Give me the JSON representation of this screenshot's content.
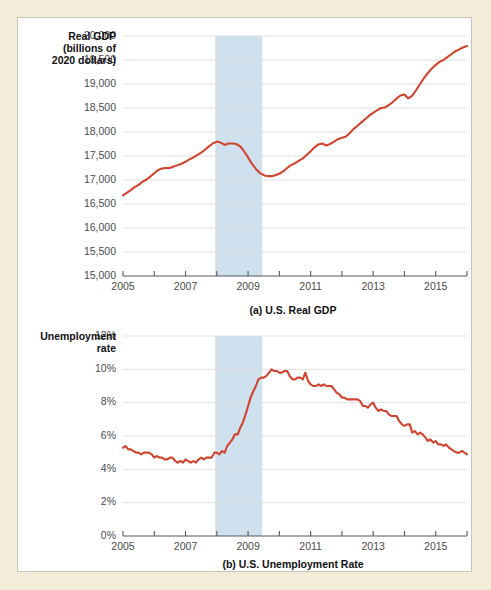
{
  "figure": {
    "background_color": "#f2ecd9",
    "panel_color": "#ffffff",
    "line_color": "#d1442f",
    "recession_band_color": "#cfe0ef",
    "gridline_color": "#dcdcde",
    "axis_color": "#58585a"
  },
  "chart_data": [
    {
      "type": "line",
      "id": "us-real-gdp",
      "title": "(a) U.S. Real GDP",
      "ylabel": "Real GDP (billions of 2020 dollars)",
      "ylabel_lines": [
        "Real GDP",
        "(billions of",
        "2020 dollars)"
      ],
      "xlabel": "",
      "grid": true,
      "legend": "none",
      "xlim": [
        2005.0,
        2016.0
      ],
      "ylim": [
        15000,
        20000
      ],
      "ytick_labels": [
        "15,000",
        "15,500",
        "16,000",
        "16,500",
        "17,000",
        "17,500",
        "18,000",
        "18,500",
        "19,000",
        "19,500",
        "20,000"
      ],
      "ytick_values": [
        15000,
        15500,
        16000,
        16500,
        17000,
        17500,
        18000,
        18500,
        19000,
        19500,
        20000
      ],
      "xtick_values": [
        2005,
        2006,
        2007,
        2008,
        2009,
        2010,
        2011,
        2012,
        2013,
        2014,
        2015,
        2016
      ],
      "xtick_labels": [
        "2005",
        "",
        "2007",
        "",
        "2009",
        "",
        "2011",
        "",
        "2013",
        "",
        "2015",
        ""
      ],
      "annotations": [
        {
          "name": "recession-shading",
          "x_start": 2007.95,
          "x_end": 2009.45,
          "label": "Great Recession"
        }
      ],
      "x": [
        2005.0,
        2005.12,
        2005.25,
        2005.37,
        2005.5,
        2005.62,
        2005.75,
        2005.87,
        2006.0,
        2006.12,
        2006.25,
        2006.37,
        2006.5,
        2006.62,
        2006.75,
        2006.87,
        2007.0,
        2007.12,
        2007.25,
        2007.37,
        2007.5,
        2007.62,
        2007.75,
        2007.87,
        2008.0,
        2008.12,
        2008.25,
        2008.37,
        2008.5,
        2008.62,
        2008.75,
        2008.87,
        2009.0,
        2009.12,
        2009.25,
        2009.37,
        2009.5,
        2009.62,
        2009.75,
        2009.87,
        2010.0,
        2010.12,
        2010.25,
        2010.37,
        2010.5,
        2010.62,
        2010.75,
        2010.87,
        2011.0,
        2011.12,
        2011.25,
        2011.37,
        2011.5,
        2011.62,
        2011.75,
        2011.87,
        2012.0,
        2012.12,
        2012.25,
        2012.37,
        2012.5,
        2012.62,
        2012.75,
        2012.87,
        2013.0,
        2013.12,
        2013.25,
        2013.37,
        2013.5,
        2013.62,
        2013.75,
        2013.87,
        2014.0,
        2014.12,
        2014.25,
        2014.37,
        2014.5,
        2014.62,
        2014.75,
        2014.87,
        2015.0,
        2015.12,
        2015.25,
        2015.37,
        2015.5,
        2015.62,
        2015.75,
        2015.87,
        2016.0
      ],
      "y": [
        16680,
        16730,
        16790,
        16850,
        16900,
        16960,
        17010,
        17070,
        17140,
        17210,
        17240,
        17250,
        17250,
        17280,
        17310,
        17340,
        17380,
        17430,
        17470,
        17520,
        17570,
        17630,
        17700,
        17760,
        17800,
        17780,
        17730,
        17760,
        17760,
        17750,
        17700,
        17600,
        17470,
        17340,
        17230,
        17150,
        17100,
        17080,
        17080,
        17100,
        17130,
        17180,
        17250,
        17310,
        17350,
        17400,
        17450,
        17520,
        17600,
        17680,
        17740,
        17760,
        17720,
        17750,
        17800,
        17850,
        17880,
        17900,
        17980,
        18060,
        18130,
        18200,
        18270,
        18340,
        18400,
        18450,
        18500,
        18510,
        18560,
        18620,
        18700,
        18760,
        18780,
        18700,
        18760,
        18870,
        19000,
        19120,
        19230,
        19320,
        19400,
        19460,
        19500,
        19560,
        19620,
        19680,
        19720,
        19760,
        19790
      ]
    },
    {
      "type": "line",
      "id": "us-unemployment-rate",
      "title": "(b) U.S. Unemployment Rate",
      "ylabel": "Unemployment rate",
      "ylabel_lines": [
        "Unemployment",
        "rate"
      ],
      "xlabel": "",
      "grid": true,
      "legend": "none",
      "xlim": [
        2005.0,
        2016.0
      ],
      "ylim": [
        0,
        12
      ],
      "ytick_labels": [
        "0%",
        "2%",
        "4%",
        "6%",
        "8%",
        "10%",
        "12%"
      ],
      "ytick_values": [
        0,
        2,
        4,
        6,
        8,
        10,
        12
      ],
      "xtick_values": [
        2005,
        2006,
        2007,
        2008,
        2009,
        2010,
        2011,
        2012,
        2013,
        2014,
        2015,
        2016
      ],
      "xtick_labels": [
        "2005",
        "",
        "2007",
        "",
        "2009",
        "",
        "2011",
        "",
        "2013",
        "",
        "2015",
        ""
      ],
      "annotations": [
        {
          "name": "recession-shading",
          "x_start": 2007.95,
          "x_end": 2009.45,
          "label": "Great Recession"
        }
      ],
      "x": [
        2005.0,
        2005.08,
        2005.17,
        2005.25,
        2005.33,
        2005.42,
        2005.5,
        2005.58,
        2005.67,
        2005.75,
        2005.83,
        2005.92,
        2006.0,
        2006.08,
        2006.17,
        2006.25,
        2006.33,
        2006.42,
        2006.5,
        2006.58,
        2006.67,
        2006.75,
        2006.83,
        2006.92,
        2007.0,
        2007.08,
        2007.17,
        2007.25,
        2007.33,
        2007.42,
        2007.5,
        2007.58,
        2007.67,
        2007.75,
        2007.83,
        2007.92,
        2008.0,
        2008.08,
        2008.17,
        2008.25,
        2008.33,
        2008.42,
        2008.5,
        2008.58,
        2008.67,
        2008.75,
        2008.83,
        2008.92,
        2009.0,
        2009.08,
        2009.17,
        2009.25,
        2009.33,
        2009.42,
        2009.5,
        2009.58,
        2009.67,
        2009.75,
        2009.83,
        2009.92,
        2010.0,
        2010.08,
        2010.17,
        2010.25,
        2010.33,
        2010.42,
        2010.5,
        2010.58,
        2010.67,
        2010.75,
        2010.83,
        2010.92,
        2011.0,
        2011.08,
        2011.17,
        2011.25,
        2011.33,
        2011.42,
        2011.5,
        2011.58,
        2011.67,
        2011.75,
        2011.83,
        2011.92,
        2012.0,
        2012.08,
        2012.17,
        2012.25,
        2012.33,
        2012.42,
        2012.5,
        2012.58,
        2012.67,
        2012.75,
        2012.83,
        2012.92,
        2013.0,
        2013.08,
        2013.17,
        2013.25,
        2013.33,
        2013.42,
        2013.5,
        2013.58,
        2013.67,
        2013.75,
        2013.83,
        2013.92,
        2014.0,
        2014.08,
        2014.17,
        2014.25,
        2014.33,
        2014.42,
        2014.5,
        2014.58,
        2014.67,
        2014.75,
        2014.83,
        2014.92,
        2015.0,
        2015.08,
        2015.17,
        2015.25,
        2015.33,
        2015.42,
        2015.5,
        2015.58,
        2015.67,
        2015.75,
        2015.83,
        2015.92,
        2016.0
      ],
      "y": [
        5.3,
        5.4,
        5.2,
        5.2,
        5.1,
        5.0,
        5.0,
        4.9,
        5.0,
        5.0,
        5.0,
        4.9,
        4.7,
        4.8,
        4.7,
        4.7,
        4.6,
        4.6,
        4.7,
        4.7,
        4.5,
        4.4,
        4.5,
        4.4,
        4.6,
        4.5,
        4.4,
        4.5,
        4.4,
        4.6,
        4.7,
        4.6,
        4.7,
        4.7,
        4.7,
        5.0,
        5.0,
        4.9,
        5.1,
        5.0,
        5.4,
        5.6,
        5.8,
        6.1,
        6.1,
        6.5,
        6.8,
        7.3,
        7.8,
        8.3,
        8.7,
        9.0,
        9.4,
        9.5,
        9.5,
        9.6,
        9.8,
        10.0,
        9.9,
        9.9,
        9.8,
        9.8,
        9.9,
        9.9,
        9.6,
        9.4,
        9.4,
        9.5,
        9.5,
        9.4,
        9.8,
        9.3,
        9.1,
        9.0,
        9.0,
        9.1,
        9.0,
        9.1,
        9.0,
        9.0,
        9.0,
        8.8,
        8.6,
        8.5,
        8.3,
        8.3,
        8.2,
        8.2,
        8.2,
        8.2,
        8.2,
        8.1,
        7.8,
        7.8,
        7.7,
        7.9,
        8.0,
        7.7,
        7.5,
        7.6,
        7.5,
        7.5,
        7.3,
        7.2,
        7.2,
        7.2,
        6.9,
        6.7,
        6.6,
        6.7,
        6.7,
        6.2,
        6.3,
        6.1,
        6.2,
        6.1,
        5.9,
        5.7,
        5.8,
        5.6,
        5.7,
        5.5,
        5.5,
        5.4,
        5.5,
        5.3,
        5.2,
        5.1,
        5.0,
        5.0,
        5.1,
        5.0,
        4.9
      ]
    }
  ]
}
